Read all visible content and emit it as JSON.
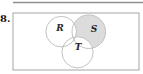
{
  "figure": {
    "problem_number": "8.",
    "colors": {
      "background": "#ffffff",
      "top_rule": "#8f8f8f",
      "rect_border": "#a5a5a5",
      "circle_stroke": "#c2c2c2",
      "shade_fill": "#dcdcdc",
      "label_color": "#262626",
      "number_color": "#141414"
    },
    "universe_rect": {
      "x": 13,
      "y": 13,
      "w": 126,
      "h": 57
    },
    "top_rule": {
      "x1": 13,
      "y1": 2.5,
      "x2": 143,
      "y2": 2.5
    },
    "venn": {
      "shaded_region": "S only (part of S outside R and T)",
      "circles": [
        {
          "label": "R",
          "cx": 61.2,
          "cy": 31.6,
          "r": 15.3,
          "label_x": 60,
          "label_y": 30.7
        },
        {
          "label": "S",
          "cx": 88.8,
          "cy": 31.7,
          "r": 16.8,
          "label_x": 94,
          "label_y": 32.3
        },
        {
          "label": "T",
          "cx": 77.5,
          "cy": 52.3,
          "r": 15.6,
          "label_x": 78,
          "label_y": 50.2
        }
      ]
    }
  }
}
